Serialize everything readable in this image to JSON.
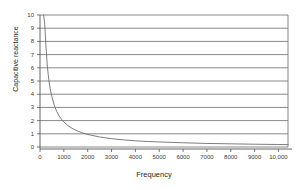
{
  "chart_data": {
    "type": "line",
    "title": "",
    "xlabel": "Frequency",
    "ylabel": "Capacitive reactance",
    "xlim": [
      0,
      10400
    ],
    "ylim": [
      0,
      10
    ],
    "grid": true,
    "grid_axis": "y",
    "legend": false,
    "x_ticks": [
      0,
      1000,
      2000,
      3000,
      4000,
      5000,
      6000,
      7000,
      8000,
      9000,
      10000
    ],
    "x_tick_labels": [
      "0",
      "1000",
      "2000",
      "3000",
      "4000",
      "5000",
      "6000",
      "7000",
      "8000",
      "9000",
      "10,000"
    ],
    "y_ticks": [
      0,
      1,
      2,
      3,
      4,
      5,
      6,
      7,
      8,
      9,
      10
    ],
    "y_tick_labels": [
      "0",
      "1",
      "2",
      "3",
      "4",
      "5",
      "6",
      "7",
      "8",
      "9",
      "10"
    ],
    "series": [
      {
        "name": "Capacitive reactance",
        "relation": "inverse",
        "color": "#6e6e6e",
        "x": [
          150,
          200,
          250,
          300,
          350,
          400,
          450,
          500,
          600,
          700,
          800,
          900,
          1000,
          1200,
          1400,
          1600,
          1800,
          2000,
          2500,
          3000,
          3500,
          4000,
          4500,
          5000,
          6000,
          7000,
          8000,
          9000,
          10000,
          10400
        ],
        "values": [
          10,
          9.3,
          7.6,
          6.3,
          5.4,
          4.7,
          4.2,
          3.8,
          3.15,
          2.7,
          2.36,
          2.1,
          1.9,
          1.58,
          1.36,
          1.19,
          1.05,
          0.95,
          0.76,
          0.63,
          0.54,
          0.47,
          0.42,
          0.38,
          0.32,
          0.27,
          0.24,
          0.21,
          0.19,
          0.18
        ]
      }
    ],
    "axis_color": "#555555",
    "grid_color": "#6a6a6a",
    "background": "#ffffff"
  }
}
